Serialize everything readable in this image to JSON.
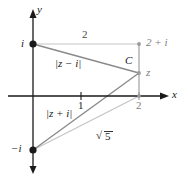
{
  "figure": {
    "kind": "complex-plane-diagram",
    "title": "",
    "axes": {
      "x_label": "x",
      "y_label": "y",
      "x_ticks": [
        "1",
        "2"
      ],
      "y_ticks": [
        "i",
        "-i"
      ]
    },
    "points": [
      {
        "name": "i",
        "label": "i",
        "x": 0,
        "y": 1,
        "marker": "dot-filled",
        "color": "#1a1a1a"
      },
      {
        "name": "minus-i",
        "label": "-i",
        "x": 0,
        "y": -1,
        "marker": "dot-filled",
        "color": "#1a1a1a"
      },
      {
        "name": "two-plus-i",
        "label": "2 + i",
        "x": 2,
        "y": 1,
        "marker": "dot-small",
        "color": "#9a9a9a"
      },
      {
        "name": "z",
        "label": "z",
        "x": 2,
        "y": 0.5,
        "marker": "dot-small",
        "color": "#9a9a9a"
      },
      {
        "name": "two",
        "label": "2",
        "x": 2,
        "y": 0,
        "marker": "dot-small",
        "color": "#9a9a9a"
      }
    ],
    "segments": [
      {
        "name": "top-horizontal",
        "label": "2",
        "color": "#c4c4c4"
      },
      {
        "name": "contour-c",
        "label": "C",
        "color": "#c4c4c4"
      },
      {
        "name": "z-minus-i",
        "label": "|z − i|",
        "color": "#8a8a8a"
      },
      {
        "name": "z-plus-i",
        "label": "|z + i|",
        "color": "#8a8a8a"
      },
      {
        "name": "hypotenuse",
        "label": "√5",
        "color": "#c4c4c4"
      }
    ],
    "labels": {
      "top_length": "2",
      "contour": "C",
      "dist_upper": "|z − i|",
      "dist_lower": "|z + i|",
      "hyp": "5",
      "radical_sign": "√",
      "corner": "2 + i",
      "z": "z",
      "tick_one": "1",
      "tick_two": "2",
      "axis_x": "x",
      "axis_y": "y",
      "point_i": "i",
      "point_minus_i": "−i"
    },
    "colors": {
      "axis": "#1a1a1a",
      "dark_line": "#6e6e6e",
      "light_line": "#c6c6c6",
      "mid_line": "#8a8a8a",
      "text": "#1a1a1a",
      "text_gray": "#7d7d7d",
      "background": "#ffffff"
    }
  }
}
